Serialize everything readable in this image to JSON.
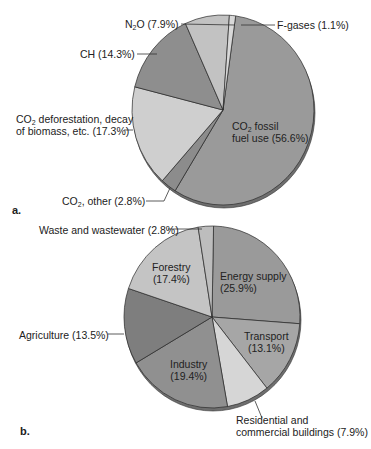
{
  "chart_data": [
    {
      "type": "pie",
      "panel": "a.",
      "title": "",
      "slices": [
        {
          "label": "CO2 fossil fuel use",
          "value": 56.6,
          "color": "#9a9a9a"
        },
        {
          "label": "CO2, other",
          "value": 2.8,
          "color": "#8c8c8c"
        },
        {
          "label": "CO2 deforestation, decay of biomass, etc.",
          "value": 17.3,
          "color": "#cfcfcf"
        },
        {
          "label": "CH",
          "value": 14.3,
          "color": "#8e8e8e"
        },
        {
          "label": "N2O",
          "value": 7.9,
          "color": "#c2c2c2"
        },
        {
          "label": "F-gases",
          "value": 1.1,
          "color": "#d8d8d8"
        }
      ]
    },
    {
      "type": "pie",
      "panel": "b.",
      "title": "",
      "slices": [
        {
          "label": "Energy supply",
          "value": 25.9,
          "color": "#9a9a9a"
        },
        {
          "label": "Transport",
          "value": 13.1,
          "color": "#a6a6a6"
        },
        {
          "label": "Residential and commercial buildings",
          "value": 7.9,
          "color": "#d6d6d6"
        },
        {
          "label": "Industry",
          "value": 19.4,
          "color": "#909090"
        },
        {
          "label": "Agriculture",
          "value": 13.5,
          "color": "#7e7e7e"
        },
        {
          "label": "Forestry",
          "value": 17.4,
          "color": "#c4c4c4"
        },
        {
          "label": "Waste and wastewater",
          "value": 2.8,
          "color": "#bdbdbd"
        }
      ]
    }
  ],
  "labels_a": {
    "n2o": "N2O (7.9%)",
    "fgases": "F-gases (1.1%)",
    "ch": "CH (14.3%)",
    "defor_line1": "CO2 deforestation, decay",
    "defor_line2": "of biomass, etc. (17.3%)",
    "fossil_line1": "CO2 fossil",
    "fossil_line2": "fuel use (56.6%)",
    "other": "CO2, other (2.8%)",
    "panel": "a."
  },
  "labels_b": {
    "waste": "Waste and wastewater (2.8%)",
    "forestry_line1": "Forestry",
    "forestry_line2": "(17.4%)",
    "energy_line1": "Energy supply",
    "energy_line2": "(25.9%)",
    "agriculture": "Agriculture (13.5%)",
    "transport_line1": "Transport",
    "transport_line2": "(13.1%)",
    "industry_line1": "Industry",
    "industry_line2": "(19.4%)",
    "residential_line1": "Residential and",
    "residential_line2": "commercial buildings (7.9%)",
    "panel": "b."
  }
}
